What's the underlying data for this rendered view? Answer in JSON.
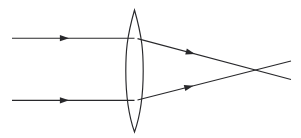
{
  "figure": {
    "canvas": {
      "width": 301,
      "height": 138
    },
    "background_color": "#ffffff",
    "stroke_color": "#28282b",
    "stroke_width": 1.15
  },
  "optical_axis": {
    "label": "optical axis",
    "y": 69,
    "visible": false
  },
  "lens": {
    "label": "biconvex converging lens",
    "type": "biconvex",
    "center_x": 134.5,
    "top_apex_y": 10,
    "bottom_apex_y": 132,
    "half_width": 8.7,
    "left_edge_x": 125.8,
    "right_edge_x": 143.2,
    "path": "M 134.5 10 C 126.6 38 125.8 52 125.8 71 C 125.8 92 127.4 112 134.5 132 C 141.6 112 143.2 92 143.2 71 C 143.2 52 142.4 38 134.5 10 Z"
  },
  "rays": [
    {
      "name": "upper-incident-ray",
      "label": "upper parallel incident ray",
      "kind": "incident",
      "path": "M 12 38.2 L 134.5 38.2",
      "arrow": {
        "x": 64.5,
        "y": 38.2,
        "angle": 0
      }
    },
    {
      "name": "lower-incident-ray",
      "label": "lower parallel incident ray",
      "kind": "incident",
      "path": "M 12 100.3 L 134.5 100.3",
      "arrow": {
        "x": 64.5,
        "y": 100.3,
        "angle": 0
      }
    },
    {
      "name": "upper-refracted-ray",
      "label": "upper refracted ray converging to focus",
      "kind": "refracted",
      "path": "M 137.5 38.6 L 291 79.5",
      "arrow": {
        "x": 190.5,
        "y": 52.7,
        "angle": 14.9
      }
    },
    {
      "name": "lower-refracted-ray",
      "label": "lower refracted ray converging to focus",
      "kind": "refracted",
      "path": "M 137.5 100.0 L 291 61.0",
      "arrow": {
        "x": 189.0,
        "y": 86.8,
        "angle": -14.3
      }
    }
  ],
  "focal_point": {
    "label": "focal point",
    "x": 272,
    "y": 69.7,
    "marked": false
  }
}
